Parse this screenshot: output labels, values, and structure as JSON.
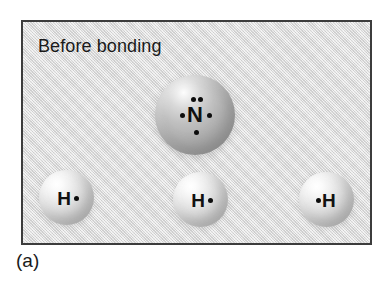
{
  "figure": {
    "caption": "(a)",
    "panel_title": "Before bonding",
    "background_color": "#dcdcdc",
    "border_color": "#3c3c3c"
  },
  "atoms": [
    {
      "id": "nitrogen",
      "element_symbol": "N",
      "element_name": "nitrogen",
      "sphere_color": "#aeaeae",
      "valence_electrons": 5,
      "dots": [
        {
          "position": "top-left"
        },
        {
          "position": "top-right"
        },
        {
          "position": "left"
        },
        {
          "position": "right"
        },
        {
          "position": "bottom"
        }
      ]
    },
    {
      "id": "hydrogen-left",
      "element_symbol": "H",
      "element_name": "hydrogen",
      "sphere_color": "#dedede",
      "valence_electrons": 1,
      "dots": [
        {
          "position": "right"
        }
      ]
    },
    {
      "id": "hydrogen-center",
      "element_symbol": "H",
      "element_name": "hydrogen",
      "sphere_color": "#dedede",
      "valence_electrons": 1,
      "dots": [
        {
          "position": "right"
        }
      ]
    },
    {
      "id": "hydrogen-right",
      "element_symbol": "H",
      "element_name": "hydrogen",
      "sphere_color": "#dedede",
      "valence_electrons": 1,
      "dots": [
        {
          "position": "left"
        }
      ]
    }
  ]
}
